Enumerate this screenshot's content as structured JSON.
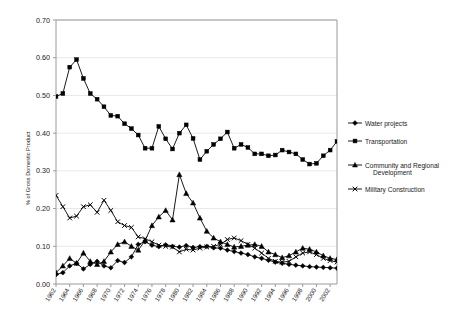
{
  "chart_data": {
    "type": "line",
    "title": "",
    "xlabel": "",
    "ylabel": "% of Gross Domestic Product",
    "ylim": [
      0.0,
      0.7
    ],
    "ytick_labels": [
      "0.00",
      "0.10",
      "0.20",
      "0.30",
      "0.40",
      "0.50",
      "0.60",
      "0.70"
    ],
    "ytick_values": [
      0.0,
      0.1,
      0.2,
      0.3,
      0.4,
      0.5,
      0.6,
      0.7
    ],
    "grid": true,
    "legend_position": "right",
    "x": [
      1962,
      1963,
      1964,
      1965,
      1966,
      1967,
      1968,
      1969,
      1970,
      1971,
      1972,
      1973,
      1974,
      1975,
      1976,
      1977,
      1978,
      1979,
      1980,
      1981,
      1982,
      1983,
      1984,
      1985,
      1986,
      1987,
      1988,
      1989,
      1990,
      1991,
      1992,
      1993,
      1994,
      1995,
      1996,
      1997,
      1998,
      1999,
      2000,
      2001,
      2002,
      2003
    ],
    "xtick_labels": [
      "1962",
      "1964",
      "1966",
      "1968",
      "1970",
      "1972",
      "1974",
      "1976",
      "1978",
      "1980",
      "1982",
      "1984",
      "1986",
      "1988",
      "1990",
      "1992",
      "1994",
      "1996",
      "1998",
      "2000",
      "2002"
    ],
    "xtick_values": [
      1962,
      1964,
      1966,
      1968,
      1970,
      1972,
      1974,
      1976,
      1978,
      1980,
      1982,
      1984,
      1986,
      1988,
      1990,
      1992,
      1994,
      1996,
      1998,
      2000,
      2002
    ],
    "series": [
      {
        "name": "Water projects",
        "marker": "diamond",
        "values": [
          0.025,
          0.03,
          0.048,
          0.055,
          0.04,
          0.052,
          0.06,
          0.048,
          0.043,
          0.062,
          0.057,
          0.072,
          0.105,
          0.112,
          0.103,
          0.099,
          0.104,
          0.1,
          0.098,
          0.102,
          0.097,
          0.099,
          0.1,
          0.096,
          0.095,
          0.09,
          0.086,
          0.082,
          0.078,
          0.072,
          0.068,
          0.063,
          0.058,
          0.055,
          0.052,
          0.05,
          0.048,
          0.046,
          0.045,
          0.044,
          0.043,
          0.042
        ]
      },
      {
        "name": "Transportation",
        "marker": "square",
        "values": [
          0.497,
          0.505,
          0.575,
          0.595,
          0.545,
          0.505,
          0.49,
          0.47,
          0.447,
          0.445,
          0.425,
          0.412,
          0.395,
          0.36,
          0.36,
          0.418,
          0.385,
          0.358,
          0.4,
          0.422,
          0.386,
          0.33,
          0.352,
          0.37,
          0.385,
          0.403,
          0.36,
          0.37,
          0.362,
          0.345,
          0.345,
          0.34,
          0.342,
          0.355,
          0.35,
          0.345,
          0.33,
          0.318,
          0.32,
          0.34,
          0.355,
          0.378
        ]
      },
      {
        "name": "Community and Regional Development",
        "marker": "triangle",
        "values": [
          0.03,
          0.048,
          0.068,
          0.055,
          0.082,
          0.06,
          0.052,
          0.06,
          0.085,
          0.105,
          0.112,
          0.1,
          0.09,
          0.115,
          0.155,
          0.178,
          0.195,
          0.17,
          0.29,
          0.24,
          0.215,
          0.175,
          0.14,
          0.122,
          0.112,
          0.105,
          0.098,
          0.1,
          0.103,
          0.105,
          0.1,
          0.085,
          0.078,
          0.07,
          0.075,
          0.085,
          0.095,
          0.092,
          0.085,
          0.075,
          0.068,
          0.065
        ]
      },
      {
        "name": "Military Construction",
        "marker": "cross",
        "values": [
          0.235,
          0.205,
          0.175,
          0.18,
          0.205,
          0.21,
          0.19,
          0.222,
          0.195,
          0.165,
          0.155,
          0.15,
          0.125,
          0.12,
          0.112,
          0.103,
          0.1,
          0.098,
          0.085,
          0.092,
          0.09,
          0.095,
          0.098,
          0.1,
          0.105,
          0.118,
          0.122,
          0.115,
          0.105,
          0.095,
          0.082,
          0.068,
          0.06,
          0.058,
          0.06,
          0.072,
          0.082,
          0.085,
          0.078,
          0.068,
          0.062,
          0.058
        ]
      }
    ]
  },
  "legend": {
    "items": [
      {
        "label": "Water projects"
      },
      {
        "label": "Transportation"
      },
      {
        "label": "Community and Regional"
      },
      {
        "label": "Development"
      },
      {
        "label": "Military Construction"
      }
    ]
  }
}
